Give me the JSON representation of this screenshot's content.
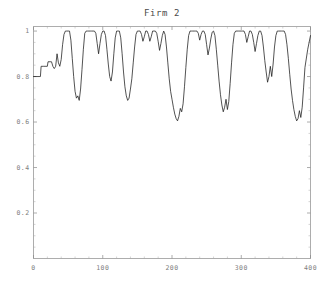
{
  "chart_data": {
    "type": "line",
    "title": "Firm 2",
    "xlabel": "",
    "ylabel": "",
    "xlim": [
      0,
      400
    ],
    "ylim": [
      0,
      1.02
    ],
    "grid": false,
    "legend": null,
    "line_color": "#1a1a1a",
    "axis_color": "#8a8a8a",
    "background_color": "#ffffff",
    "xticks": [
      0,
      100,
      200,
      300,
      400
    ],
    "xtick_labels": [
      "0",
      "100",
      "200",
      "300",
      "400"
    ],
    "yticks": [
      0.2,
      0.4,
      0.6,
      0.8,
      1
    ],
    "ytick_labels": [
      "0.2",
      "0.4",
      "0.6",
      "0.8",
      "1"
    ],
    "x_minor_step": 20,
    "y_minor_step": 0.05,
    "x": [
      0,
      4,
      8,
      10,
      11,
      14,
      18,
      20,
      21,
      24,
      26,
      28,
      30,
      32,
      34,
      36,
      38,
      40,
      42,
      44,
      46,
      48,
      50,
      52,
      54,
      56,
      58,
      60,
      62,
      64,
      66,
      68,
      70,
      72,
      74,
      76,
      78,
      80,
      82,
      84,
      86,
      88,
      90,
      92,
      94,
      96,
      98,
      100,
      102,
      104,
      106,
      108,
      110,
      112,
      114,
      116,
      118,
      120,
      122,
      124,
      126,
      128,
      130,
      132,
      134,
      136,
      138,
      140,
      142,
      144,
      146,
      148,
      150,
      152,
      154,
      156,
      158,
      160,
      162,
      164,
      166,
      168,
      170,
      172,
      174,
      176,
      178,
      180,
      182,
      184,
      186,
      188,
      190,
      192,
      194,
      196,
      198,
      200,
      202,
      204,
      206,
      208,
      210,
      212,
      214,
      216,
      218,
      220,
      222,
      224,
      226,
      228,
      230,
      232,
      234,
      236,
      238,
      240,
      242,
      244,
      246,
      248,
      250,
      252,
      254,
      256,
      258,
      260,
      262,
      264,
      266,
      268,
      270,
      272,
      274,
      276,
      278,
      280,
      282,
      284,
      286,
      288,
      290,
      292,
      294,
      296,
      298,
      300,
      302,
      304,
      306,
      308,
      310,
      312,
      314,
      316,
      318,
      320,
      322,
      324,
      326,
      328,
      330,
      332,
      334,
      336,
      338,
      340,
      342,
      344,
      346,
      348,
      350,
      352,
      354,
      356,
      358,
      360,
      362,
      364,
      366,
      368,
      370,
      372,
      374,
      376,
      378,
      380,
      382,
      384,
      386,
      388,
      390,
      392,
      396,
      400
    ],
    "y": [
      0.8,
      0.8,
      0.8,
      0.8,
      0.845,
      0.845,
      0.845,
      0.845,
      0.865,
      0.865,
      0.865,
      0.845,
      0.835,
      0.845,
      0.9,
      0.86,
      0.845,
      0.875,
      0.94,
      0.985,
      1.0,
      1.0,
      1.0,
      1.0,
      0.96,
      0.88,
      0.8,
      0.735,
      0.705,
      0.715,
      0.695,
      0.745,
      0.83,
      0.92,
      0.99,
      1.0,
      1.0,
      1.0,
      1.0,
      1.0,
      1.0,
      1.0,
      0.99,
      0.945,
      0.9,
      0.945,
      0.985,
      1.0,
      1.0,
      0.98,
      0.92,
      0.855,
      0.8,
      0.78,
      0.82,
      0.9,
      0.97,
      1.0,
      1.0,
      1.0,
      0.97,
      0.9,
      0.82,
      0.755,
      0.715,
      0.695,
      0.705,
      0.745,
      0.79,
      0.86,
      0.93,
      0.985,
      1.0,
      1.0,
      1.0,
      0.985,
      0.955,
      0.975,
      1.0,
      1.0,
      0.985,
      0.955,
      0.975,
      1.0,
      1.0,
      1.0,
      0.99,
      0.955,
      0.915,
      0.945,
      0.98,
      1.0,
      0.985,
      0.93,
      0.86,
      0.79,
      0.735,
      0.7,
      0.665,
      0.635,
      0.615,
      0.605,
      0.625,
      0.66,
      0.645,
      0.68,
      0.755,
      0.84,
      0.92,
      0.98,
      1.0,
      1.0,
      1.0,
      1.0,
      1.0,
      1.0,
      0.99,
      0.96,
      0.985,
      1.0,
      1.0,
      0.985,
      0.94,
      0.895,
      0.925,
      0.965,
      0.995,
      1.0,
      0.98,
      0.92,
      0.85,
      0.78,
      0.72,
      0.675,
      0.645,
      0.665,
      0.7,
      0.655,
      0.69,
      0.77,
      0.86,
      0.94,
      0.99,
      1.0,
      1.0,
      1.0,
      1.0,
      1.0,
      1.0,
      1.0,
      0.985,
      0.95,
      0.975,
      1.0,
      1.0,
      0.985,
      0.95,
      0.91,
      0.945,
      0.98,
      1.0,
      1.0,
      0.98,
      0.93,
      0.87,
      0.82,
      0.775,
      0.8,
      0.845,
      0.8,
      0.855,
      0.93,
      0.98,
      1.0,
      1.0,
      1.0,
      1.0,
      1.0,
      1.0,
      0.985,
      0.94,
      0.88,
      0.81,
      0.745,
      0.695,
      0.655,
      0.625,
      0.605,
      0.615,
      0.65,
      0.62,
      0.665,
      0.75,
      0.84,
      0.92,
      0.98,
      1.0,
      1.0,
      1.0,
      1.0,
      1.0,
      1.0,
      1.0,
      0.98,
      0.945,
      0.975,
      1.0,
      1.0,
      0.985,
      0.945,
      0.9,
      0.935,
      0.975,
      1.0,
      1.0,
      0.97,
      0.9,
      0.83,
      0.765,
      0.72,
      0.695,
      0.715,
      0.68,
      0.7,
      0.775,
      0.86,
      0.94,
      0.99,
      1.0,
      1.0,
      1.0,
      1.0,
      1.0,
      0.985,
      0.95,
      0.915,
      0.945,
      0.98,
      1.0,
      1.0,
      0.985,
      0.94,
      0.895,
      0.925,
      0.965,
      1.0,
      1.0,
      1.0
    ]
  }
}
